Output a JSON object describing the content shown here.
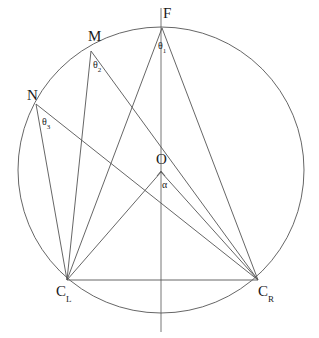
{
  "figure": {
    "stroke_color": "#555555",
    "axis_color": "#666666",
    "text_color": "#1a1a1a",
    "background_color": "#ffffff",
    "line_width": 0.9,
    "width": 319,
    "height": 338
  },
  "chart_data": {
    "type": "diagram",
    "circle": {
      "cx": 161,
      "cy": 170,
      "r": 143
    },
    "points": [
      {
        "id": "F",
        "label": "F",
        "sub": "",
        "x": 162,
        "y": 28,
        "label_x": 163,
        "label_y": 6,
        "on_circle": true
      },
      {
        "id": "M",
        "label": "M",
        "sub": "",
        "x": 91,
        "y": 51,
        "label_x": 88,
        "label_y": 29,
        "on_circle": true
      },
      {
        "id": "N",
        "label": "N",
        "sub": "",
        "x": 36,
        "y": 104,
        "label_x": 27,
        "label_y": 88,
        "on_circle": true
      },
      {
        "id": "O",
        "label": "O",
        "sub": "",
        "x": 161,
        "y": 172,
        "label_x": 156,
        "label_y": 152,
        "on_circle": false
      },
      {
        "id": "CL",
        "label": "C",
        "sub": "L",
        "x": 67,
        "y": 280,
        "label_x": 56,
        "label_y": 284,
        "on_circle": true
      },
      {
        "id": "CR",
        "label": "C",
        "sub": "R",
        "x": 258,
        "y": 280,
        "label_x": 258,
        "label_y": 284,
        "on_circle": true
      }
    ],
    "angles": [
      {
        "id": "theta1",
        "label": "θ",
        "sub": "1",
        "vertex": "F",
        "label_x": 158,
        "label_y": 41,
        "rays": [
          "CL",
          "CR"
        ]
      },
      {
        "id": "theta2",
        "label": "θ",
        "sub": "2",
        "vertex": "M",
        "label_x": 93,
        "label_y": 60,
        "rays": [
          "CL",
          "CR"
        ]
      },
      {
        "id": "theta3",
        "label": "θ",
        "sub": "3",
        "vertex": "N",
        "label_x": 42,
        "label_y": 117,
        "rays": [
          "CL",
          "CR"
        ]
      },
      {
        "id": "alpha",
        "label": "α",
        "sub": "",
        "vertex": "O",
        "label_x": 162,
        "label_y": 180,
        "rays": [
          "F",
          "CL"
        ]
      }
    ],
    "segments": [
      {
        "from": "F",
        "to": "CL"
      },
      {
        "from": "F",
        "to": "CR"
      },
      {
        "from": "M",
        "to": "CL"
      },
      {
        "from": "M",
        "to": "CR"
      },
      {
        "from": "N",
        "to": "CL"
      },
      {
        "from": "N",
        "to": "CR"
      },
      {
        "from": "O",
        "to": "CL"
      },
      {
        "from": "O",
        "to": "CR"
      },
      {
        "from": "CL",
        "to": "CR"
      }
    ],
    "axis": {
      "x": 161,
      "y_top": 8,
      "y_bottom": 332,
      "label": "vertical symmetry axis"
    }
  }
}
